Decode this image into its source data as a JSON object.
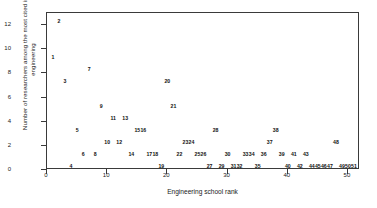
{
  "chart_data": {
    "type": "scatter",
    "title": "",
    "xlabel": "Engineering school rank",
    "ylabel": "Number of researchers among the most cited in all engineering",
    "xlim": [
      0,
      52
    ],
    "ylim": [
      0,
      13
    ],
    "xticks": [
      "0",
      "10",
      "20",
      "30",
      "40",
      "50"
    ],
    "xtick_values": [
      0,
      10,
      20,
      30,
      40,
      50
    ],
    "yticks": [
      "0",
      "2",
      "4",
      "6",
      "8",
      "10",
      "12"
    ],
    "ytick_values": [
      0,
      2,
      4,
      6,
      8,
      10,
      12
    ],
    "grid": false,
    "legend": null,
    "point_style": "rank-number-label",
    "points": [
      {
        "label": "1",
        "x": 1,
        "y": 9
      },
      {
        "label": "2",
        "x": 2,
        "y": 12
      },
      {
        "label": "3",
        "x": 3,
        "y": 7
      },
      {
        "label": "4",
        "x": 4,
        "y": 0
      },
      {
        "label": "5",
        "x": 5,
        "y": 3
      },
      {
        "label": "6",
        "x": 6,
        "y": 1
      },
      {
        "label": "7",
        "x": 7,
        "y": 8
      },
      {
        "label": "8",
        "x": 8,
        "y": 1
      },
      {
        "label": "9",
        "x": 9,
        "y": 5
      },
      {
        "label": "10",
        "x": 10,
        "y": 2
      },
      {
        "label": "11",
        "x": 11,
        "y": 4
      },
      {
        "label": "12",
        "x": 12,
        "y": 2
      },
      {
        "label": "13",
        "x": 13,
        "y": 4
      },
      {
        "label": "14",
        "x": 14,
        "y": 1
      },
      {
        "label": "15",
        "x": 15,
        "y": 3
      },
      {
        "label": "16",
        "x": 16,
        "y": 3
      },
      {
        "label": "17",
        "x": 17,
        "y": 1
      },
      {
        "label": "18",
        "x": 18,
        "y": 1
      },
      {
        "label": "19",
        "x": 19,
        "y": 0
      },
      {
        "label": "20",
        "x": 20,
        "y": 7
      },
      {
        "label": "21",
        "x": 21,
        "y": 5
      },
      {
        "label": "22",
        "x": 22,
        "y": 1
      },
      {
        "label": "23",
        "x": 23,
        "y": 2
      },
      {
        "label": "24",
        "x": 24,
        "y": 2
      },
      {
        "label": "25",
        "x": 25,
        "y": 1
      },
      {
        "label": "26",
        "x": 26,
        "y": 1
      },
      {
        "label": "27",
        "x": 27,
        "y": 0
      },
      {
        "label": "28",
        "x": 28,
        "y": 3
      },
      {
        "label": "29",
        "x": 29,
        "y": 0
      },
      {
        "label": "30",
        "x": 30,
        "y": 1
      },
      {
        "label": "31",
        "x": 31,
        "y": 0
      },
      {
        "label": "32",
        "x": 32,
        "y": 0
      },
      {
        "label": "33",
        "x": 33,
        "y": 1
      },
      {
        "label": "34",
        "x": 34,
        "y": 1
      },
      {
        "label": "35",
        "x": 35,
        "y": 0
      },
      {
        "label": "36",
        "x": 36,
        "y": 1
      },
      {
        "label": "37",
        "x": 37,
        "y": 2
      },
      {
        "label": "38",
        "x": 38,
        "y": 3
      },
      {
        "label": "39",
        "x": 39,
        "y": 1
      },
      {
        "label": "40",
        "x": 40,
        "y": 0
      },
      {
        "label": "41",
        "x": 41,
        "y": 1
      },
      {
        "label": "42",
        "x": 42,
        "y": 0
      },
      {
        "label": "43",
        "x": 43,
        "y": 1
      },
      {
        "label": "44",
        "x": 44,
        "y": 0
      },
      {
        "label": "45",
        "x": 45,
        "y": 0
      },
      {
        "label": "46",
        "x": 46,
        "y": 0
      },
      {
        "label": "47",
        "x": 47,
        "y": 0
      },
      {
        "label": "48",
        "x": 48,
        "y": 2
      },
      {
        "label": "49",
        "x": 49,
        "y": 0
      },
      {
        "label": "50",
        "x": 50,
        "y": 0
      },
      {
        "label": "51",
        "x": 51,
        "y": 0
      }
    ]
  }
}
